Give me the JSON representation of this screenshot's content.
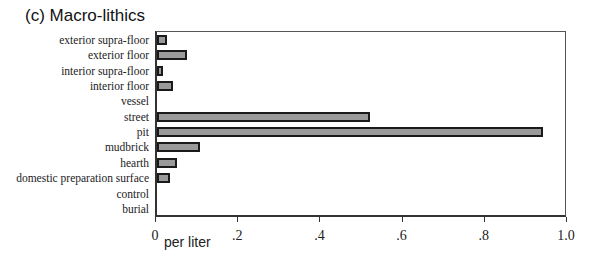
{
  "chart_data": {
    "type": "bar",
    "orientation": "horizontal",
    "title": "(c) Macro-lithics",
    "xlabel": "per liter",
    "ylabel": "",
    "xlim": [
      0,
      1.0
    ],
    "x_ticks": [
      "0",
      ".2",
      ".4",
      ".6",
      ".8",
      "1.0"
    ],
    "grid": false,
    "legend": null,
    "categories": [
      "exterior supra-floor",
      "exterior floor",
      "interior supra-floor",
      "interior floor",
      "vessel",
      "street",
      "pit",
      "mudbrick",
      "hearth",
      "domestic preparation surface",
      "control",
      "burial"
    ],
    "values": [
      0.024,
      0.073,
      0.015,
      0.039,
      0,
      0.52,
      0.944,
      0.105,
      0.049,
      0.032,
      0,
      0
    ]
  },
  "colors": {
    "bar_fill": "#9a9a9a",
    "bar_edge": "#1a1a1a"
  }
}
